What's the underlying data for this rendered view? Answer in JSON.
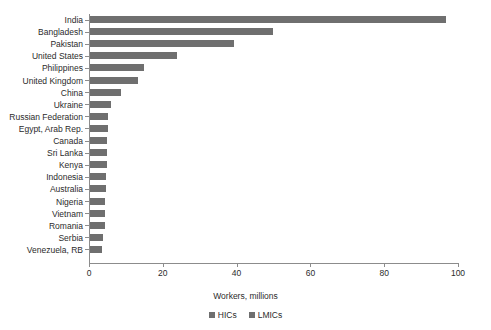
{
  "chart_data": {
    "type": "bar",
    "orientation": "horizontal",
    "title": "",
    "xlabel": "Workers, millions",
    "ylabel": "",
    "xlim": [
      0,
      100
    ],
    "xticks": [
      0,
      20,
      40,
      60,
      80,
      100
    ],
    "grid": false,
    "legend_position": "bottom",
    "categories": [
      "India",
      "Bangladesh",
      "Pakistan",
      "United States",
      "Philippines",
      "United Kingdom",
      "China",
      "Ukraine",
      "Russian Federation",
      "Egypt, Arab Rep.",
      "Canada",
      "Sri Lanka",
      "Kenya",
      "Indonesia",
      "Australia",
      "Nigeria",
      "Vietnam",
      "Romania",
      "Serbia",
      "Venezuela, RB"
    ],
    "values": [
      96.5,
      49.5,
      39.0,
      23.5,
      14.5,
      13.0,
      8.5,
      5.8,
      5.0,
      4.8,
      4.7,
      4.6,
      4.5,
      4.4,
      4.3,
      4.2,
      4.1,
      4.0,
      3.6,
      3.2
    ],
    "legend": [
      {
        "label": "HICs",
        "color": "#6f6f6f"
      },
      {
        "label": "LMICs",
        "color": "#6f6f6f"
      }
    ],
    "series_assignment": [
      "LMICs",
      "LMICs",
      "LMICs",
      "HICs",
      "LMICs",
      "HICs",
      "LMICs",
      "LMICs",
      "LMICs",
      "LMICs",
      "HICs",
      "LMICs",
      "LMICs",
      "LMICs",
      "HICs",
      "LMICs",
      "LMICs",
      "HICs",
      "LMICs",
      "LMICs"
    ],
    "bar_color": "#6f6f6f",
    "axis_color": "#8c8c8c",
    "text_color": "#2b2b2b"
  }
}
